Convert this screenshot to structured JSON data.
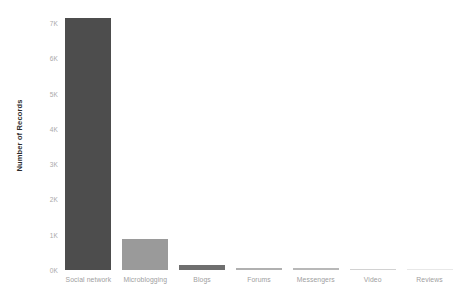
{
  "chart_data": {
    "type": "bar",
    "title": "",
    "subtitle": "",
    "xlabel": "",
    "ylabel": "Number of Records",
    "categories": [
      "Social network",
      "Microblogging",
      "Blogs",
      "Forums",
      "Messengers",
      "Video",
      "Reviews"
    ],
    "values": [
      7150,
      870,
      135,
      55,
      45,
      20,
      2
    ],
    "bar_colors": [
      "#4d4d4d",
      "#9a9a9a",
      "#6f6f6f",
      "#b0b0b0",
      "#b8b8b8",
      "#d2d2d2",
      "#e8e8e8"
    ],
    "ylim": [
      0,
      7200
    ],
    "ytick_values": [
      0,
      1000,
      2000,
      3000,
      4000,
      5000,
      6000,
      7000
    ],
    "ytick_labels": [
      "0K",
      "1K",
      "2K",
      "3K",
      "4K",
      "5K",
      "6K",
      "7K"
    ],
    "grid": false,
    "legend": null,
    "legend_position": "none",
    "background_color": "#ffffff",
    "tick_label_color": "#a9a9a9",
    "axis_title_color": "#2b2b2b"
  }
}
